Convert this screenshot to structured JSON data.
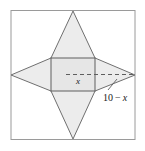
{
  "figure": {
    "background_color": "#ffffff",
    "frame": {
      "name": "outer-border",
      "stroke_color": "#9a9a9a",
      "x": 11,
      "y": 10.5,
      "width": 124,
      "height": 129
    },
    "star": {
      "name": "four-pointed-star",
      "fill_color": "#ececec",
      "stroke_color": "#6f6f6f",
      "points": [
        {
          "label": "top-point",
          "x": 73,
          "y": 11
        },
        {
          "label": "square-top-right",
          "x": 95,
          "y": 58
        },
        {
          "label": "right-point",
          "x": 135,
          "y": 75
        },
        {
          "label": "square-bottom-right",
          "x": 95,
          "y": 91
        },
        {
          "label": "bottom-point",
          "x": 73,
          "y": 139
        },
        {
          "label": "square-bottom-left",
          "x": 51,
          "y": 91
        },
        {
          "label": "left-point",
          "x": 11,
          "y": 75
        },
        {
          "label": "square-top-left",
          "x": 51,
          "y": 58
        }
      ]
    },
    "square": {
      "name": "inner-square",
      "fill_color": "#e6e6e6",
      "stroke_color": "#5e5e5e",
      "x": 51,
      "y": 58,
      "width": 44,
      "height": 33
    },
    "dashed_segment": {
      "name": "width-dimension-line",
      "stroke_color": "#5e5e5e",
      "style": "dashed",
      "x1": 66,
      "y1": 74.5,
      "x2": 134,
      "y2": 74.5
    },
    "leader": {
      "name": "leader-line",
      "stroke_color": "#5e5e5e",
      "x1": 109,
      "y1": 88,
      "x2": 117,
      "y2": 80
    }
  },
  "labels": {
    "side_x": {
      "text": "x",
      "x": 78,
      "y": 83
    },
    "remaining_length": {
      "prefix": "10",
      "operator": "−",
      "variable": "x",
      "x": 103,
      "y": 100
    }
  }
}
